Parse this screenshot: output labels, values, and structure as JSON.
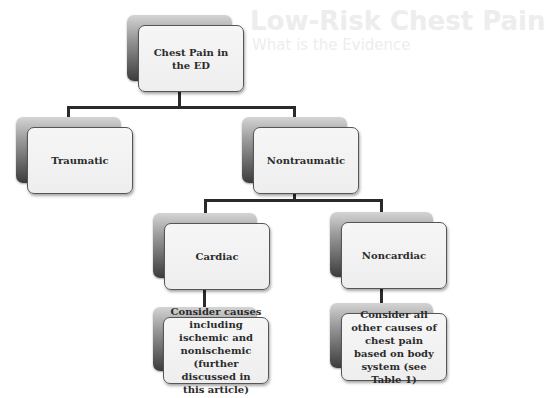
{
  "background_text": {
    "title": "Low-Risk Chest Pain",
    "subtitle": "What is the Evidence"
  },
  "diagram": {
    "root": {
      "label": "Chest Pain in the ED"
    },
    "level1": [
      {
        "label": "Traumatic"
      },
      {
        "label": "Nontraumatic"
      }
    ],
    "level2": [
      {
        "label": "Cardiac"
      },
      {
        "label": "Noncardiac"
      }
    ],
    "level3": [
      {
        "label": "Consider causes including ischemic and nonischemic (further discussed in this article)"
      },
      {
        "label": "Consider all other causes of chest pain based on body system (see Table 1)"
      }
    ]
  },
  "colors": {
    "connector": "#2a2a2a",
    "box_fill": "#f2f2f2",
    "box_border": "#555555",
    "shadow_top": "#d4d4d4",
    "shadow_bottom": "#3c3c3c"
  }
}
